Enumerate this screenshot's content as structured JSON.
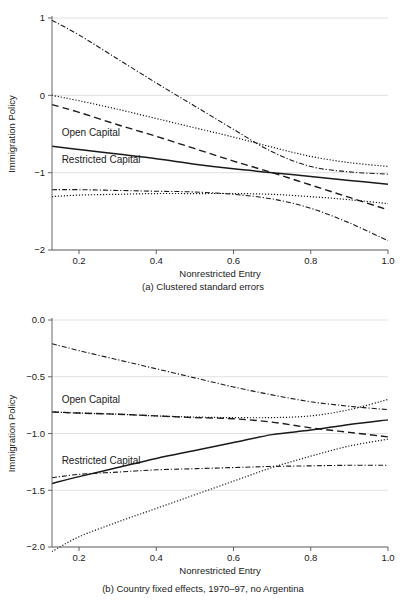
{
  "figure": {
    "axis_label_y": "Immigration Policy",
    "axis_label_x": "Nonrestricted Entry",
    "label_open_capital": "Open Capital",
    "label_restricted_capital": "Restricted Capital",
    "ink": "#1a1a1a",
    "grid": "#d9d9d9",
    "axis": "#555555"
  },
  "chart_data": [
    {
      "type": "line",
      "panel_id": "a",
      "title": "",
      "caption": "(a) Clustered standard errors",
      "xlabel": "Nonrestricted Entry",
      "ylabel": "Immigration Policy",
      "xlim": [
        0.13,
        1.0
      ],
      "ylim": [
        -2.0,
        1.0
      ],
      "xticks": [
        0.2,
        0.4,
        0.6,
        0.8,
        1.0
      ],
      "xticklabels": [
        "0.2",
        "0.4",
        "0.6",
        "0.8",
        "1.0"
      ],
      "yticks": [
        1,
        0,
        -1,
        -2
      ],
      "yticklabels": [
        "1",
        "0",
        "-1",
        "-2"
      ],
      "grid": true,
      "legend": "inline-annotations",
      "annotations": [
        {
          "text": "Open Capital",
          "x": 0.155,
          "y": -0.53
        },
        {
          "text": "Restricted Capital",
          "x": 0.155,
          "y": -0.87
        }
      ],
      "x": [
        0.13,
        0.2,
        0.3,
        0.4,
        0.5,
        0.6,
        0.7,
        0.8,
        0.9,
        1.0
      ],
      "series": [
        {
          "name": "Open Capital (marginal effect)",
          "style": "dashed",
          "values": [
            -0.12,
            -0.22,
            -0.38,
            -0.53,
            -0.69,
            -0.85,
            -1.0,
            -1.16,
            -1.32,
            -1.48
          ]
        },
        {
          "name": "Open Capital 95% CI upper",
          "style": "dotted",
          "values": [
            0.0,
            -0.07,
            -0.18,
            -0.3,
            -0.42,
            -0.54,
            -0.67,
            -0.79,
            -0.87,
            -0.92
          ]
        },
        {
          "name": "Open Capital 95% CI lower",
          "style": "dotted",
          "values": [
            -1.31,
            -1.29,
            -1.28,
            -1.27,
            -1.27,
            -1.27,
            -1.28,
            -1.31,
            -1.35,
            -1.4
          ]
        },
        {
          "name": "Restricted Capital (marginal effect)",
          "style": "solid",
          "values": [
            -0.66,
            -0.7,
            -0.76,
            -0.82,
            -0.89,
            -0.95,
            -1.0,
            -1.05,
            -1.1,
            -1.15
          ]
        },
        {
          "name": "Restricted Capital 95% CI upper",
          "style": "dashdot",
          "values": [
            0.97,
            0.78,
            0.47,
            0.16,
            -0.14,
            -0.44,
            -0.73,
            -0.92,
            -0.99,
            -1.02
          ]
        },
        {
          "name": "Restricted Capital 95% CI lower",
          "style": "dashdot",
          "values": [
            -1.22,
            -1.22,
            -1.23,
            -1.24,
            -1.25,
            -1.28,
            -1.34,
            -1.46,
            -1.65,
            -1.88
          ]
        }
      ]
    },
    {
      "type": "line",
      "panel_id": "b",
      "title": "",
      "caption": "(b) Country fixed effects, 1970–97, no Argentina",
      "xlabel": "Nonrestricted Entry",
      "ylabel": "Immigration Policy",
      "xlim": [
        0.13,
        1.0
      ],
      "ylim": [
        -2.0,
        0.0
      ],
      "xticks": [
        0.2,
        0.4,
        0.6,
        0.8,
        1.0
      ],
      "xticklabels": [
        "0.2",
        "0.4",
        "0.6",
        "0.8",
        "1.0"
      ],
      "yticks": [
        0.0,
        -0.5,
        -1.0,
        -1.5,
        -2.0
      ],
      "yticklabels": [
        "0.0",
        "-0.5",
        "-1.0",
        "-1.5",
        "-2.0"
      ],
      "grid": true,
      "legend": "inline-annotations",
      "annotations": [
        {
          "text": "Open Capital",
          "x": 0.155,
          "y": -0.73
        },
        {
          "text": "Restricted Capital",
          "x": 0.155,
          "y": -1.27
        }
      ],
      "x": [
        0.13,
        0.2,
        0.3,
        0.4,
        0.5,
        0.6,
        0.7,
        0.8,
        0.9,
        1.0
      ],
      "series": [
        {
          "name": "Open Capital (marginal effect)",
          "style": "dashed",
          "values": [
            -0.81,
            -0.82,
            -0.83,
            -0.845,
            -0.86,
            -0.87,
            -0.9,
            -0.95,
            -0.99,
            -1.03
          ]
        },
        {
          "name": "Open Capital 95% CI upper",
          "style": "dotted",
          "values": [
            -0.81,
            -0.82,
            -0.83,
            -0.845,
            -0.855,
            -0.86,
            -0.86,
            -0.845,
            -0.79,
            -0.7
          ]
        },
        {
          "name": "Open Capital 95% CI lower",
          "style": "dotted",
          "values": [
            -2.04,
            -1.91,
            -1.78,
            -1.66,
            -1.54,
            -1.42,
            -1.3,
            -1.2,
            -1.11,
            -1.05
          ]
        },
        {
          "name": "Restricted Capital (marginal effect)",
          "style": "solid",
          "values": [
            -1.44,
            -1.38,
            -1.3,
            -1.22,
            -1.15,
            -1.08,
            -1.01,
            -0.97,
            -0.92,
            -0.88
          ]
        },
        {
          "name": "Restricted Capital 95% CI upper",
          "style": "dashdot",
          "values": [
            -0.21,
            -0.27,
            -0.35,
            -0.43,
            -0.51,
            -0.59,
            -0.66,
            -0.72,
            -0.76,
            -0.79
          ]
        },
        {
          "name": "Restricted Capital 95% CI lower",
          "style": "dashdot",
          "values": [
            -1.39,
            -1.36,
            -1.34,
            -1.32,
            -1.31,
            -1.3,
            -1.29,
            -1.285,
            -1.28,
            -1.28
          ]
        }
      ]
    }
  ]
}
